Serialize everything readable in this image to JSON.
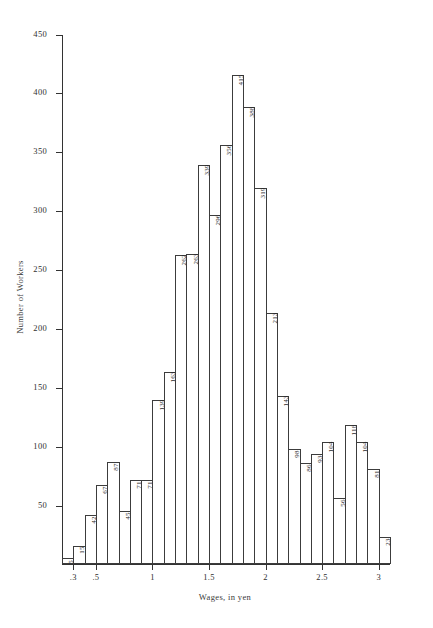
{
  "chart_data": {
    "type": "bar",
    "title": "",
    "xlabel": "Wages, in yen",
    "ylabel": "Number of Workers",
    "ylim": [
      0,
      450
    ],
    "xlim": [
      0.2,
      3.1
    ],
    "bin_width": 0.1,
    "grid": false,
    "legend": null,
    "y_ticks": [
      0,
      50,
      100,
      150,
      200,
      250,
      300,
      350,
      400,
      450
    ],
    "y_tick_labels": [
      "",
      "50",
      "100",
      "150",
      "200",
      "250",
      "300",
      "350",
      "400",
      "450"
    ],
    "x_ticks": [
      0.3,
      0.5,
      1,
      1.5,
      2,
      2.5,
      3
    ],
    "x_tick_labels": [
      ".3",
      ".5",
      "1",
      "1.5",
      "2",
      "2.5",
      "3"
    ],
    "bin_starts": [
      0.2,
      0.3,
      0.4,
      0.5,
      0.6,
      0.7,
      0.8,
      0.9,
      1.0,
      1.1,
      1.2,
      1.3,
      1.4,
      1.5,
      1.6,
      1.7,
      1.8,
      1.9,
      2.0,
      2.1,
      2.2,
      2.3,
      2.4,
      2.5,
      2.6,
      2.7,
      2.8,
      2.9,
      3.0
    ],
    "categories": [
      "0.2",
      "0.3",
      "0.4",
      "0.5",
      "0.6",
      "0.7",
      "0.8",
      "0.9",
      "1.0",
      "1.1",
      "1.2",
      "1.3",
      "1.4",
      "1.5",
      "1.6",
      "1.7",
      "1.8",
      "1.9",
      "2.0",
      "2.1",
      "2.2",
      "2.3",
      "2.4",
      "2.5",
      "2.6",
      "2.7",
      "2.8",
      "2.9",
      "3.0"
    ],
    "values": [
      5,
      15,
      42,
      67,
      87,
      45,
      71,
      71,
      139,
      163,
      262,
      263,
      339,
      296,
      356,
      415,
      388,
      319,
      213,
      143,
      98,
      86,
      93,
      104,
      56,
      118,
      104,
      81,
      23
    ],
    "value_labels": [
      "5",
      "15",
      "42",
      "67",
      "87",
      "45",
      "71",
      "71",
      "139",
      "163",
      "262",
      "263",
      "339",
      "296",
      "356",
      "415",
      "388",
      "319",
      "213",
      "143",
      "98",
      "86",
      "93",
      "104",
      "56",
      "118",
      "104",
      "81",
      "23"
    ]
  },
  "style": {
    "bar_fill": "#ffffff",
    "bar_stroke": "#3c3c3c",
    "axis_color": "#333333",
    "text_color": "#2a2a2a",
    "background": "#ffffff"
  }
}
